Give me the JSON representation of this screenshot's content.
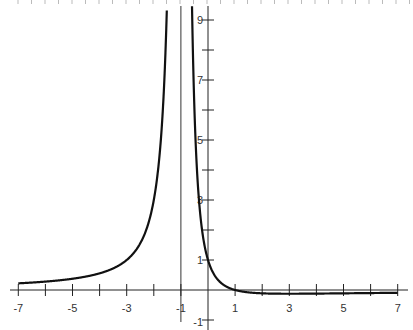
{
  "chart_data": {
    "type": "line",
    "title": "",
    "function": "y = (1 - x) / (x + 1)^2",
    "xlabel": "",
    "ylabel": "",
    "xlim": [
      -7.3,
      7.5
    ],
    "ylim": [
      -1.35,
      9.6
    ],
    "grid": false,
    "legend": null,
    "x_tick_labels": [
      "-7",
      "-5",
      "-3",
      "-1",
      "1",
      "3",
      "5",
      "7"
    ],
    "x_tick_values": [
      -7,
      -6,
      -5,
      -4,
      -3,
      -2,
      -1,
      0,
      1,
      2,
      3,
      4,
      5,
      6,
      7
    ],
    "y_tick_labels": [
      "-1",
      "1",
      "3",
      "5",
      "7",
      "9"
    ],
    "y_tick_values": [
      -1,
      1,
      2,
      3,
      4,
      5,
      6,
      7,
      8,
      9
    ],
    "vertical_asymptote": -1,
    "series": [
      {
        "name": "left branch",
        "x": [
          -7,
          -6,
          -5,
          -4,
          -3,
          -2.5,
          -2,
          -1.8,
          -1.6,
          -1.5
        ],
        "y": [
          0.22,
          0.28,
          0.38,
          0.56,
          1.0,
          1.56,
          3.0,
          4.38,
          7.22,
          10.0
        ]
      },
      {
        "name": "right branch",
        "x": [
          -0.55,
          -0.5,
          -0.4,
          -0.3,
          -0.2,
          0,
          0.5,
          1,
          2,
          3,
          4,
          5,
          6,
          7
        ],
        "y": [
          7.65,
          6.0,
          3.89,
          2.65,
          1.88,
          1.0,
          0.22,
          0.0,
          -0.11,
          -0.125,
          -0.12,
          -0.11,
          -0.1,
          -0.094
        ]
      }
    ]
  },
  "labels": {
    "x": [
      "-7",
      "-5",
      "-3",
      "-1",
      "1",
      "3",
      "5",
      "7"
    ],
    "y": [
      "-1",
      "1",
      "3",
      "5",
      "7",
      "9"
    ]
  }
}
